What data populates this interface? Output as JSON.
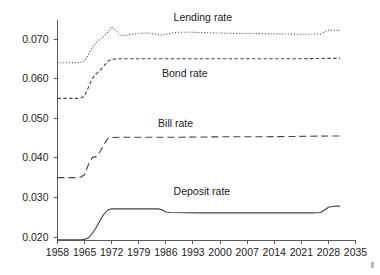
{
  "chart_data": {
    "type": "line",
    "title": "",
    "subtitle": "",
    "xlabel": "",
    "ylabel": "",
    "xlim": [
      1958,
      2035
    ],
    "ylim": [
      0.02,
      0.07
    ],
    "grid": false,
    "legend_position": "inline-annotations",
    "x_ticks": [
      1958,
      1965,
      1972,
      1979,
      1986,
      1993,
      2000,
      2007,
      2014,
      2021,
      2028,
      2035
    ],
    "x_tick_labels": [
      "1958",
      "1965",
      "1972",
      "1979",
      "1986",
      "1993",
      "2000",
      "2007",
      "2014",
      "2021",
      "2028",
      "2035"
    ],
    "y_ticks": [
      0.02,
      0.03,
      0.04,
      0.05,
      0.06,
      0.07
    ],
    "y_tick_labels": [
      "0.020",
      "0.030",
      "0.040",
      "0.050",
      "0.060",
      "0.070"
    ],
    "series": [
      {
        "name": "Lending rate",
        "label": "Lending rate",
        "style": "dotted",
        "color": "#555555",
        "label_x": 1988,
        "label_y": 0.0745,
        "x": [
          1958,
          1960,
          1962,
          1963,
          1964,
          1965,
          1966,
          1967,
          1968,
          1969,
          1970,
          1971,
          1972,
          1973,
          1974,
          1975,
          1976,
          1977,
          1978,
          1979,
          1980,
          1981,
          1982,
          1983,
          1984,
          1985,
          1986,
          1987,
          1988,
          1990,
          1993,
          1996,
          2000,
          2004,
          2008,
          2012,
          2016,
          2020,
          2024,
          2026,
          2027,
          2028,
          2029,
          2030,
          2031
        ],
        "y": [
          0.064,
          0.064,
          0.064,
          0.064,
          0.0641,
          0.0645,
          0.0661,
          0.0678,
          0.0692,
          0.07,
          0.0706,
          0.0718,
          0.0731,
          0.0722,
          0.071,
          0.0708,
          0.071,
          0.0712,
          0.0713,
          0.0714,
          0.0715,
          0.0715,
          0.0714,
          0.0713,
          0.0711,
          0.071,
          0.0712,
          0.0714,
          0.0716,
          0.0717,
          0.0717,
          0.0716,
          0.0715,
          0.0714,
          0.0714,
          0.0713,
          0.0713,
          0.0712,
          0.0712,
          0.0713,
          0.0717,
          0.0722,
          0.0722,
          0.0722,
          0.0721
        ]
      },
      {
        "name": "Bond rate",
        "label": "Bond rate",
        "style": "dashed-short",
        "color": "#444444",
        "label_x": 1985,
        "label_y": 0.0605,
        "x": [
          1958,
          1960,
          1962,
          1963,
          1964,
          1965,
          1966,
          1967,
          1968,
          1969,
          1970,
          1971,
          1972,
          1974,
          1980,
          1990,
          2000,
          2010,
          2020,
          2028,
          2031
        ],
        "y": [
          0.055,
          0.055,
          0.055,
          0.055,
          0.0551,
          0.0556,
          0.0578,
          0.06,
          0.0612,
          0.0621,
          0.0632,
          0.0644,
          0.0649,
          0.065,
          0.065,
          0.065,
          0.065,
          0.065,
          0.065,
          0.0651,
          0.0651
        ]
      },
      {
        "name": "Bill rate",
        "label": "Bill rate",
        "style": "dashed-long",
        "color": "#444444",
        "label_x": 1984,
        "label_y": 0.0478,
        "x": [
          1958,
          1960,
          1962,
          1963,
          1964,
          1965,
          1966,
          1967,
          1968,
          1969,
          1970,
          1971,
          1972,
          1974,
          1980,
          1990,
          2000,
          2010,
          2020,
          2028,
          2031
        ],
        "y": [
          0.035,
          0.035,
          0.035,
          0.035,
          0.0351,
          0.0358,
          0.0383,
          0.0401,
          0.0403,
          0.0416,
          0.0433,
          0.0449,
          0.0451,
          0.0452,
          0.0452,
          0.0452,
          0.0453,
          0.0453,
          0.0454,
          0.0455,
          0.0455
        ]
      },
      {
        "name": "Deposit rate",
        "label": "Deposit rate",
        "style": "solid",
        "color": "#3a3a3a",
        "label_x": 1988,
        "label_y": 0.0307,
        "x": [
          1958,
          1962,
          1964,
          1965,
          1966,
          1967,
          1968,
          1969,
          1970,
          1971,
          1972,
          1973,
          1980,
          1984,
          1985,
          1986,
          1987,
          1995,
          2005,
          2015,
          2024,
          2026,
          2027,
          2028,
          2029,
          2030,
          2031
        ],
        "y": [
          0.0193,
          0.0193,
          0.0193,
          0.0194,
          0.0198,
          0.0209,
          0.0224,
          0.0242,
          0.0258,
          0.0268,
          0.0271,
          0.0271,
          0.0271,
          0.0271,
          0.0269,
          0.0263,
          0.0262,
          0.0261,
          0.0261,
          0.0261,
          0.0261,
          0.0262,
          0.0268,
          0.0275,
          0.0277,
          0.0278,
          0.0278
        ]
      }
    ]
  }
}
